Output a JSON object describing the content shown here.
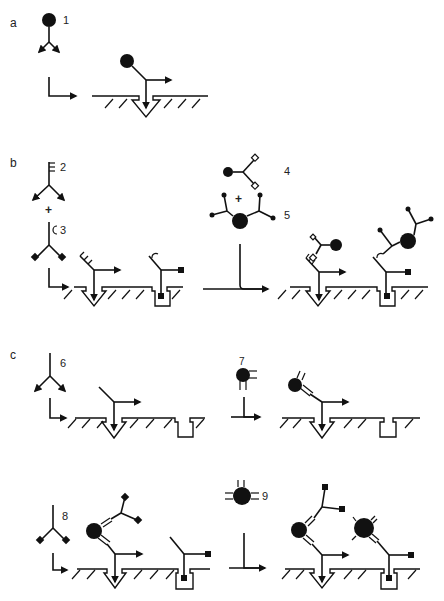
{
  "figure": {
    "panels": [
      {
        "id": "a",
        "label": "a",
        "labels": [
          {
            "text": "1"
          }
        ]
      },
      {
        "id": "b",
        "label": "b",
        "labels": [
          {
            "text": "2"
          },
          {
            "text": "+"
          },
          {
            "text": "3"
          },
          {
            "text": "4"
          },
          {
            "text": "+"
          },
          {
            "text": "5"
          }
        ]
      },
      {
        "id": "c",
        "label": "c",
        "labels": [
          {
            "text": "6"
          },
          {
            "text": "7"
          },
          {
            "text": "8"
          },
          {
            "text": "9"
          }
        ]
      }
    ],
    "colors": {
      "ink": "#111111",
      "background": "#ffffff",
      "label": "#222222"
    },
    "icons": {
      "antibody": "y-shaped-antibody-icon",
      "surface": "hatched-surface-icon",
      "triangle_well": "triangular-binding-site-icon",
      "square_well": "square-binding-site-icon",
      "reaction_arrow": "reaction-arrow-icon"
    }
  }
}
